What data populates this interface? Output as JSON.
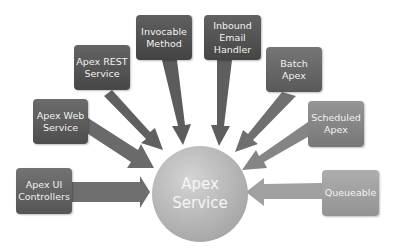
{
  "diagram": {
    "hub": {
      "label_line1": "Apex",
      "label_line2": "Service",
      "color": "#b0b0b0"
    },
    "nodes": [
      {
        "id": "apex-ui-controllers",
        "line1": "Apex UI",
        "line2": "Controllers",
        "line3": "",
        "color": "#666666"
      },
      {
        "id": "apex-web-service",
        "line1": "Apex Web",
        "line2": "Service",
        "line3": "",
        "color": "#5f5f5f"
      },
      {
        "id": "apex-rest-service",
        "line1": "Apex REST",
        "line2": "Service",
        "line3": "",
        "color": "#585858"
      },
      {
        "id": "invocable-method",
        "line1": "Invocable",
        "line2": "Method",
        "line3": "",
        "color": "#555555"
      },
      {
        "id": "inbound-email-handler",
        "line1": "Inbound",
        "line2": "Email",
        "line3": "Handler",
        "color": "#575757"
      },
      {
        "id": "batch-apex",
        "line1": "Batch Apex",
        "line2": "",
        "line3": "",
        "color": "#6a6a6a"
      },
      {
        "id": "scheduled-apex",
        "line1": "Scheduled",
        "line2": "Apex",
        "line3": "",
        "color": "#8a8a8a"
      },
      {
        "id": "queueable",
        "line1": "Queueable",
        "line2": "",
        "line3": "",
        "color": "#a3a3a3"
      }
    ],
    "arrow_color": "#7a7a7a"
  }
}
